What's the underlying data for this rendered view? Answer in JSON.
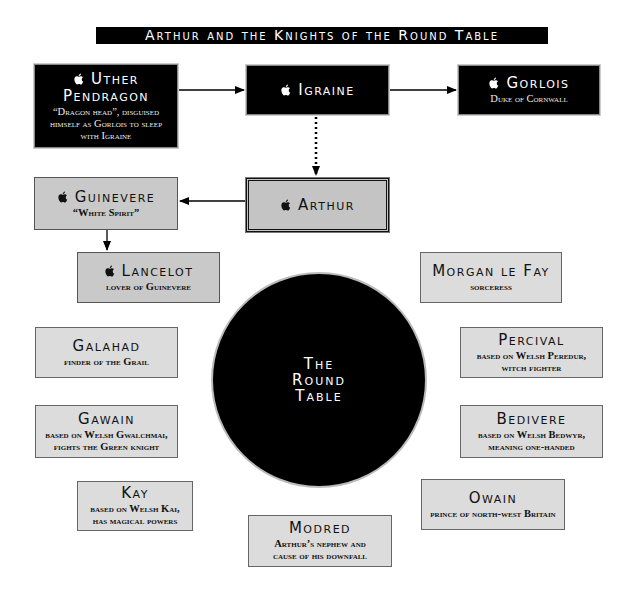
{
  "title": "Arthur and the Knights of the Round Table",
  "icons": {
    "marker": "apple-icon"
  },
  "colors": {
    "dark_box": "#000000",
    "gray_box": "#c9c9c9",
    "light_box": "#dcdcdc",
    "text_light": "#ffffff",
    "text_dark": "#111111"
  },
  "nodes": {
    "uther": {
      "name": "Uther Pendragon",
      "name_line1": "Uther",
      "name_line2": "Pendragon",
      "desc_lines": [
        "“Dragon head”, disguised",
        "himself as Gorlois to sleep",
        "with Igraine"
      ]
    },
    "igraine": {
      "name": "Igraine"
    },
    "gorlois": {
      "name": "Gorlois",
      "desc": "Duke of Cornwall"
    },
    "guinevere": {
      "name": "Guinevere",
      "desc": "“White Spirit”"
    },
    "arthur": {
      "name": "Arthur"
    },
    "lancelot": {
      "name": "Lancelot",
      "desc": "lover of Guinevere"
    },
    "morgan": {
      "name": "Morgan le Fay",
      "desc": "sorceress"
    },
    "galahad": {
      "name": "Galahad",
      "desc": "finder of the Grail"
    },
    "percival": {
      "name": "Percival",
      "desc_lines": [
        "based on Welsh Peredur,",
        "witch fighter"
      ]
    },
    "gawain": {
      "name": "Gawain",
      "desc_lines": [
        "based on Welsh Gwalchmai,",
        "fights the Green knight"
      ]
    },
    "bedivere": {
      "name": "Bedivere",
      "desc_lines": [
        "based on Welsh Bedwyr,",
        "meaning one-handed"
      ]
    },
    "kay": {
      "name": "Kay",
      "desc_lines": [
        "based on Welsh Kai,",
        "has magical powers"
      ]
    },
    "owain": {
      "name": "Owain",
      "desc": "prince of north-west Britain"
    },
    "modred": {
      "name": "Modred",
      "desc_lines": [
        "Arthur’s nephew and",
        "cause of his downfall"
      ]
    }
  },
  "round_table": {
    "lines": [
      "The",
      "Round",
      "Table"
    ]
  },
  "edges": [
    {
      "from": "uther",
      "to": "igraine",
      "style": "solid"
    },
    {
      "from": "igraine",
      "to": "gorlois",
      "style": "solid"
    },
    {
      "from": "igraine",
      "to": "arthur",
      "style": "dotted"
    },
    {
      "from": "arthur",
      "to": "guinevere",
      "style": "solid"
    },
    {
      "from": "guinevere",
      "to": "lancelot",
      "style": "solid"
    }
  ]
}
